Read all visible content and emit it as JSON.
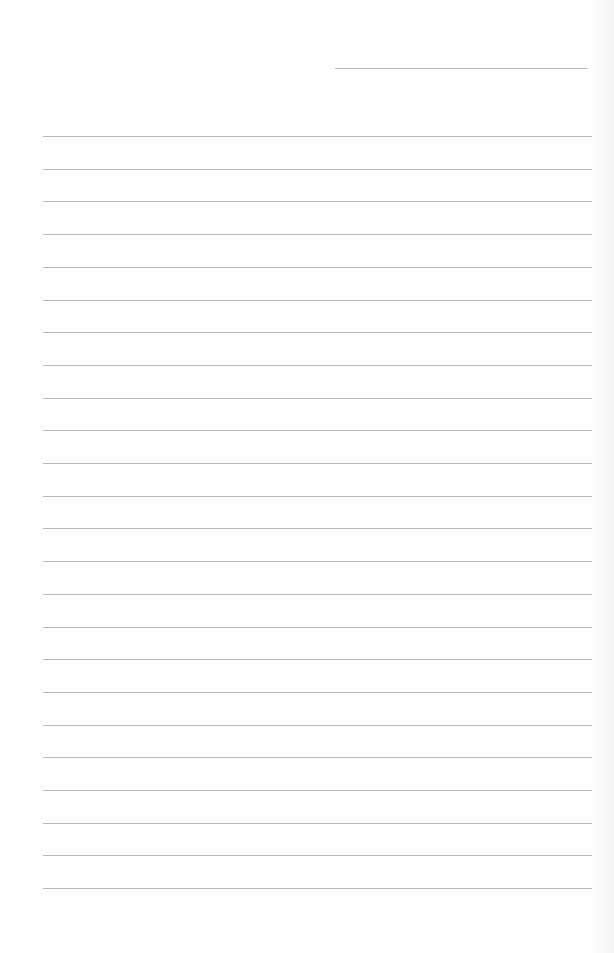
{
  "document": {
    "type": "lined-paper",
    "header_line": {
      "left": 335,
      "top": 68,
      "width": 252
    },
    "lines": {
      "count": 24,
      "left": 43,
      "width": 549,
      "first_top": 136,
      "spacing": 32.7
    },
    "colors": {
      "paper": "#fefefe",
      "rule": "#b9b9b9"
    }
  }
}
